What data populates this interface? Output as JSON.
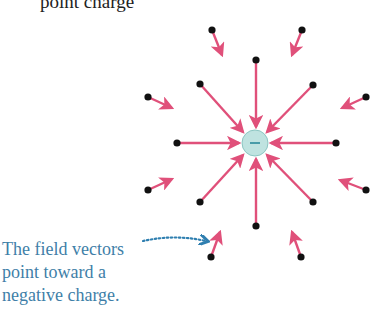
{
  "title": "point charge",
  "caption": {
    "lines": [
      "The field vectors",
      "point toward a",
      "negative charge."
    ]
  },
  "charge": {
    "cx": 255,
    "cy": 143,
    "r": 13,
    "fill": "#bfe3e0",
    "sign": "−",
    "sign_color": "#2b8a9a"
  },
  "colors": {
    "arrow": "#e0507a",
    "dot": "#111111",
    "caption": "#3f7fa8",
    "pointer": "#2f7fb0"
  },
  "vectors": [
    {
      "x1": 256,
      "y1": 60,
      "x2": 256,
      "y2": 127
    },
    {
      "x1": 200,
      "y1": 84,
      "x2": 243,
      "y2": 132
    },
    {
      "x1": 313,
      "y1": 85,
      "x2": 267,
      "y2": 132
    },
    {
      "x1": 177,
      "y1": 143,
      "x2": 239,
      "y2": 143
    },
    {
      "x1": 336,
      "y1": 143,
      "x2": 271,
      "y2": 143
    },
    {
      "x1": 200,
      "y1": 202,
      "x2": 243,
      "y2": 155
    },
    {
      "x1": 313,
      "y1": 202,
      "x2": 267,
      "y2": 155
    },
    {
      "x1": 256,
      "y1": 226,
      "x2": 256,
      "y2": 159
    },
    {
      "x1": 212,
      "y1": 30,
      "x2": 222,
      "y2": 55
    },
    {
      "x1": 302,
      "y1": 30,
      "x2": 292,
      "y2": 55
    },
    {
      "x1": 148,
      "y1": 97,
      "x2": 172,
      "y2": 108
    },
    {
      "x1": 366,
      "y1": 97,
      "x2": 342,
      "y2": 108
    },
    {
      "x1": 148,
      "y1": 190,
      "x2": 172,
      "y2": 179
    },
    {
      "x1": 366,
      "y1": 190,
      "x2": 340,
      "y2": 180
    },
    {
      "x1": 211,
      "y1": 257,
      "x2": 220,
      "y2": 232
    },
    {
      "x1": 301,
      "y1": 257,
      "x2": 292,
      "y2": 232
    }
  ]
}
